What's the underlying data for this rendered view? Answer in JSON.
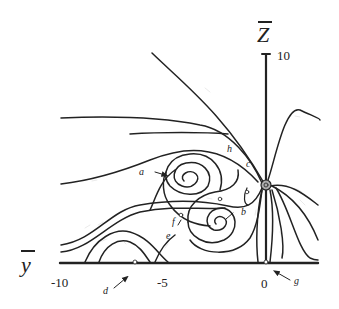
{
  "figure": {
    "type": "streamline-topology",
    "x_axis": {
      "name": "y",
      "overbar": true,
      "ticks": [
        {
          "value": -10,
          "label": "-10"
        },
        {
          "value": -5,
          "label": "-5"
        },
        {
          "value": 0,
          "label": "0"
        }
      ]
    },
    "z_axis": {
      "name": "Z",
      "overbar": true,
      "ticks": [
        {
          "value": 10,
          "label": "10"
        }
      ]
    },
    "point_labels": {
      "a": "a",
      "b": "b",
      "c": "c",
      "d": "d",
      "e": "e",
      "f": "f",
      "g": "g",
      "h": "h"
    },
    "colors": {
      "line": "#222222",
      "background": "#ffffff"
    }
  }
}
